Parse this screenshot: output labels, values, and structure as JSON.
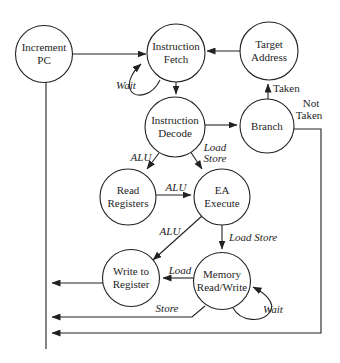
{
  "diagram": {
    "nodes": {
      "increment_pc": {
        "line1": "Increment",
        "line2": "PC"
      },
      "instruction_fetch": {
        "line1": "Instruction",
        "line2": "Fetch"
      },
      "target_address": {
        "line1": "Target",
        "line2": "Address"
      },
      "instruction_decode": {
        "line1": "Instruction",
        "line2": "Decode"
      },
      "branch": {
        "line1": "Branch"
      },
      "read_registers": {
        "line1": "Read",
        "line2": "Registers"
      },
      "ea_execute": {
        "line1": "EA",
        "line2": "Execute"
      },
      "write_to_register": {
        "line1": "Write to",
        "line2": "Register"
      },
      "memory_read_write": {
        "line1": "Memory",
        "line2": "Read/Write"
      }
    },
    "edge_labels": {
      "fetch_wait": "Wait",
      "taken": "Taken",
      "not_taken_line1": "Not",
      "not_taken_line2": "Taken",
      "decode_alu": "ALU",
      "decode_load": "Load",
      "decode_store": "Store",
      "readreg_ea_alu": "ALU",
      "ea_write_alu": "ALU",
      "ea_memory_load_store": "Load Store",
      "memory_write_load": "Load",
      "memory_store": "Store",
      "memory_wait": "Wait"
    },
    "colors": {
      "line": "#222222",
      "text": "#1e1e1e",
      "background": "#ffffff"
    }
  }
}
